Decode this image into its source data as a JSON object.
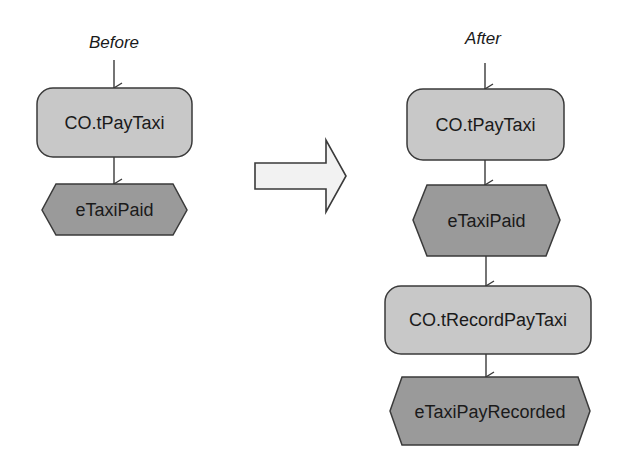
{
  "diagram": {
    "colors": {
      "background": "#ffffff",
      "function_fill": "#c8c8c8",
      "event_fill": "#9a9a9a",
      "stroke": "#3a3a3a",
      "transform_arrow_fill": "#f2f2f2"
    },
    "before": {
      "caption": "Before",
      "nodes": [
        {
          "type": "function",
          "label": "CO.tPayTaxi"
        },
        {
          "type": "event",
          "label": "eTaxiPaid"
        }
      ]
    },
    "transform_arrow": {
      "icon": "right-arrow-icon"
    },
    "after": {
      "caption": "After",
      "nodes": [
        {
          "type": "function",
          "label": "CO.tPayTaxi"
        },
        {
          "type": "event",
          "label": "eTaxiPaid"
        },
        {
          "type": "function",
          "label": "CO.tRecordPayTaxi"
        },
        {
          "type": "event",
          "label": "eTaxiPayRecorded"
        }
      ]
    }
  }
}
